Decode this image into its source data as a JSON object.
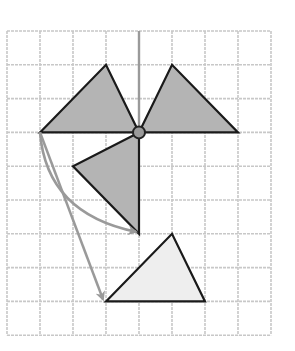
{
  "diagram": {
    "title": "Triangle transformations on a square grid",
    "grid": {
      "columns": 8,
      "rows": 9,
      "origin_px": [
        7,
        31
      ],
      "cell_w_px": 33,
      "cell_h_px": 33.8,
      "line_color": "#c8c8c8",
      "line_style": "dashed"
    },
    "axis_line": {
      "from": [
        4,
        0
      ],
      "to": [
        4,
        3
      ],
      "color": "#9a9a9a"
    },
    "center_point": {
      "at": [
        4,
        3
      ],
      "fill": "#9a9a9a",
      "stroke": "#222222"
    },
    "shapes": [
      {
        "name": "left-triangle",
        "points": [
          [
            1,
            3
          ],
          [
            3,
            1
          ],
          [
            4,
            3
          ]
        ],
        "fill": "#b4b4b4"
      },
      {
        "name": "right-triangle",
        "points": [
          [
            4,
            3
          ],
          [
            5,
            1
          ],
          [
            7,
            3
          ]
        ],
        "fill": "#b4b4b4"
      },
      {
        "name": "rotated-triangle",
        "points": [
          [
            4,
            3
          ],
          [
            2,
            4
          ],
          [
            4,
            6
          ]
        ],
        "fill": "#b4b4b4"
      },
      {
        "name": "image-triangle",
        "points": [
          [
            3,
            8
          ],
          [
            5,
            6
          ],
          [
            6,
            8
          ]
        ],
        "fill": "#eeeeee"
      }
    ],
    "arrows": [
      {
        "name": "curved-arrow",
        "from": [
          1,
          3
        ],
        "to": [
          4,
          6
        ],
        "ctrl": [
          1.2,
          5.4
        ],
        "color": "#9a9a9a"
      },
      {
        "name": "straight-arrow",
        "from": [
          1,
          3
        ],
        "to": [
          3,
          8
        ],
        "ctrl": [
          1.9,
          5.3
        ],
        "color": "#9a9a9a"
      }
    ]
  }
}
